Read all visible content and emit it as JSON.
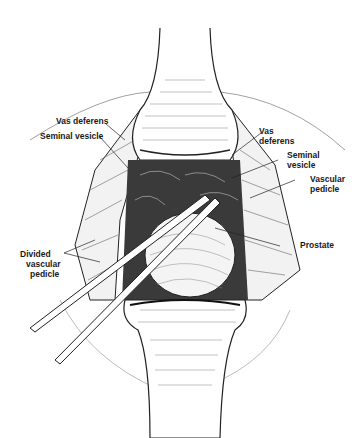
{
  "figure": {
    "type": "surgical illustration",
    "labels": {
      "vas_deferens_left": "Vas deferens",
      "seminal_vesicle_left": "Seminal vesicle",
      "vas_deferens_right": [
        "Vas",
        "deferens"
      ],
      "seminal_vesicle_right": [
        "Seminal",
        "vesicle"
      ],
      "vascular_pedicle": [
        "Vascular",
        "pedicle"
      ],
      "prostate": "Prostate",
      "divided_vascular_pedicle": [
        "Divided",
        "vascular",
        "pedicle"
      ]
    },
    "colors": {
      "ink": "#1a1a1a",
      "background": "#ffffff"
    }
  }
}
